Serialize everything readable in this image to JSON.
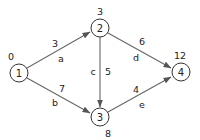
{
  "diagram": {
    "type": "directed-weighted-graph",
    "nodes": [
      {
        "id": "1",
        "label": "1",
        "value": "0",
        "x": 19,
        "y": 73
      },
      {
        "id": "2",
        "label": "2",
        "value": "3",
        "x": 100,
        "y": 28
      },
      {
        "id": "3",
        "label": "3",
        "value": "8",
        "x": 100,
        "y": 117
      },
      {
        "id": "4",
        "label": "4",
        "value": "12",
        "x": 181,
        "y": 72
      }
    ],
    "edges": [
      {
        "from": "1",
        "to": "2",
        "name": "a",
        "weight": "3"
      },
      {
        "from": "1",
        "to": "3",
        "name": "b",
        "weight": "7"
      },
      {
        "from": "2",
        "to": "3",
        "name": "c",
        "weight": "5"
      },
      {
        "from": "2",
        "to": "4",
        "name": "d",
        "weight": "6"
      },
      {
        "from": "3",
        "to": "4",
        "name": "e",
        "weight": "4"
      }
    ]
  }
}
